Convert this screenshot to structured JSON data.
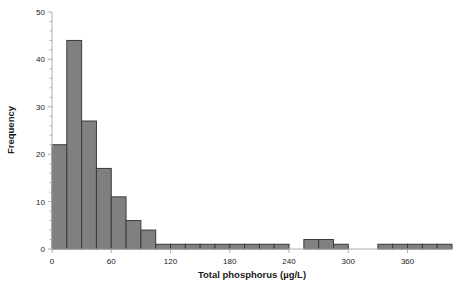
{
  "chart_data": {
    "type": "bar",
    "title": "",
    "subtitle": "",
    "xlabel": "Total phosphorus (µg/L)",
    "ylabel": "Frequency",
    "xlim": [
      0,
      405
    ],
    "ylim": [
      0,
      50
    ],
    "bin_width": 15,
    "grid": false,
    "legend": null,
    "bar_fill_color": "#808080",
    "bar_edge_color": "#3a3a3a",
    "axis_color": "#b0b0b0",
    "bin_starts": [
      0,
      15,
      30,
      45,
      60,
      75,
      90,
      105,
      120,
      135,
      150,
      165,
      180,
      195,
      210,
      225,
      240,
      255,
      270,
      285,
      300,
      315,
      330,
      345,
      360,
      375,
      390
    ],
    "categories": [
      "0–15",
      "15–30",
      "30–45",
      "45–60",
      "60–75",
      "75–90",
      "90–105",
      "105–120",
      "120–135",
      "135–150",
      "150–165",
      "165–180",
      "180–195",
      "195–210",
      "210–225",
      "225–240",
      "240–255",
      "255–270",
      "270–285",
      "285–300",
      "300–315",
      "315–330",
      "330–345",
      "345–360",
      "360–375",
      "375–390",
      "390–405"
    ],
    "values": [
      22,
      44,
      27,
      17,
      11,
      6,
      4,
      1,
      1,
      1,
      1,
      1,
      1,
      1,
      1,
      1,
      0,
      2,
      2,
      1,
      0,
      0,
      1,
      1,
      1,
      1,
      1
    ],
    "x_ticks_major": [
      0,
      60,
      120,
      180,
      240,
      300,
      360
    ],
    "x_tick_labels": [
      "0",
      "60",
      "120",
      "180",
      "240",
      "300",
      "360"
    ],
    "y_ticks_major": [
      0,
      10,
      20,
      30,
      40,
      50
    ],
    "y_tick_labels": [
      "0",
      "10",
      "20",
      "30",
      "40",
      "50"
    ],
    "y_ticks_minor": [
      2,
      4,
      6,
      8,
      12,
      14,
      16,
      18,
      22,
      24,
      26,
      28,
      32,
      34,
      36,
      38,
      42,
      44,
      46,
      48
    ]
  }
}
